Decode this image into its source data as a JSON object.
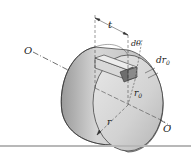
{
  "figure": {
    "labels": {
      "axis_left": "O",
      "axis_right": "O",
      "length": "t",
      "angle": "dθ",
      "radial_width": "dr",
      "radial_width_sub": "0",
      "element_radius": "r",
      "element_radius_sub": "0",
      "outer_radius": "r"
    },
    "colors": {
      "body_light": "#e2e2e2",
      "body_mid": "#bdbdbd",
      "body_dark": "#8f8f8f",
      "outline": "#333333",
      "element": "#6e6e6e",
      "divider": "#b8b8b8"
    }
  }
}
